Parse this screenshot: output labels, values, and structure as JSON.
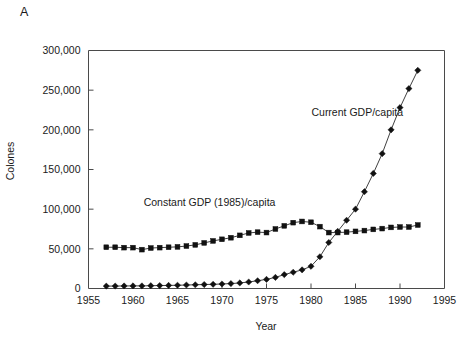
{
  "panel": {
    "label": "A"
  },
  "chart_data": {
    "type": "line",
    "title": "",
    "xlabel": "Year",
    "ylabel": "Colones",
    "xlim": [
      1955,
      1995
    ],
    "ylim": [
      0,
      300000
    ],
    "grid": false,
    "legend_position": "inline-annotation",
    "xticks": [
      1955,
      1960,
      1965,
      1970,
      1975,
      1980,
      1985,
      1990,
      1995
    ],
    "xtick_labels": [
      "1955",
      "1960",
      "1965",
      "1970",
      "1975",
      "1980",
      "1985",
      "1990",
      "1995"
    ],
    "yticks": [
      0,
      50000,
      100000,
      150000,
      200000,
      250000,
      300000
    ],
    "ytick_labels": [
      "0",
      "50,000",
      "100,000",
      "150,000",
      "200,000",
      "250,000",
      "300,000"
    ],
    "annotations": [
      {
        "text": "Current GDP/capita",
        "x": 1985.2,
        "y": 217000,
        "anchor": "middle"
      },
      {
        "text": "Constant GDP (1985)/capita",
        "x": 1968.6,
        "y": 104000,
        "anchor": "middle"
      }
    ],
    "series": [
      {
        "name": "Constant GDP (1985)/capita",
        "marker": "square",
        "x": [
          1957,
          1958,
          1959,
          1960,
          1961,
          1962,
          1963,
          1964,
          1965,
          1966,
          1967,
          1968,
          1969,
          1970,
          1971,
          1972,
          1973,
          1974,
          1975,
          1976,
          1977,
          1978,
          1979,
          1980,
          1981,
          1982,
          1983,
          1984,
          1985,
          1986,
          1987,
          1988,
          1989,
          1990,
          1991,
          1992
        ],
        "values": [
          52000,
          52000,
          51500,
          51500,
          49000,
          51000,
          51500,
          52000,
          52500,
          53500,
          55000,
          57500,
          60000,
          62000,
          64000,
          67000,
          70000,
          71000,
          70500,
          75000,
          79000,
          83000,
          84500,
          83500,
          78000,
          70500,
          70500,
          71000,
          72000,
          73000,
          74500,
          75500,
          77000,
          77500,
          77500,
          80000
        ]
      },
      {
        "name": "Current GDP/capita",
        "marker": "diamond",
        "x": [
          1957,
          1958,
          1959,
          1960,
          1961,
          1962,
          1963,
          1964,
          1965,
          1966,
          1967,
          1968,
          1969,
          1970,
          1971,
          1972,
          1973,
          1974,
          1975,
          1976,
          1977,
          1978,
          1979,
          1980,
          1981,
          1982,
          1983,
          1984,
          1985,
          1986,
          1987,
          1988,
          1989,
          1990,
          1991,
          1992
        ],
        "values": [
          3000,
          3100,
          3200,
          3300,
          3300,
          3500,
          3700,
          3900,
          4100,
          4400,
          4700,
          5000,
          5300,
          5700,
          6200,
          7000,
          8200,
          9800,
          11500,
          14000,
          17500,
          20500,
          23500,
          28000,
          40000,
          58000,
          72000,
          86000,
          100000,
          122000,
          145000,
          170000,
          200000,
          228000,
          252000,
          275000
        ]
      }
    ]
  }
}
